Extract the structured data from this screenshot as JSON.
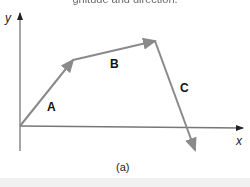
{
  "header": {
    "partial_text": "gnitude and direction."
  },
  "diagram": {
    "axes": {
      "x_label": "x",
      "y_label": "y",
      "origin": [
        20,
        126
      ],
      "color": "#777777"
    },
    "vectors": [
      {
        "label": "A",
        "from": [
          20,
          126
        ],
        "to": [
          73,
          60
        ],
        "color": "#8a8a8a"
      },
      {
        "label": "B",
        "from": [
          73,
          60
        ],
        "to": [
          155,
          41
        ],
        "color": "#8a8a8a"
      },
      {
        "label": "C",
        "from": [
          155,
          41
        ],
        "to": [
          195,
          150
        ],
        "color": "#8a8a8a"
      }
    ],
    "caption": "(a)"
  }
}
